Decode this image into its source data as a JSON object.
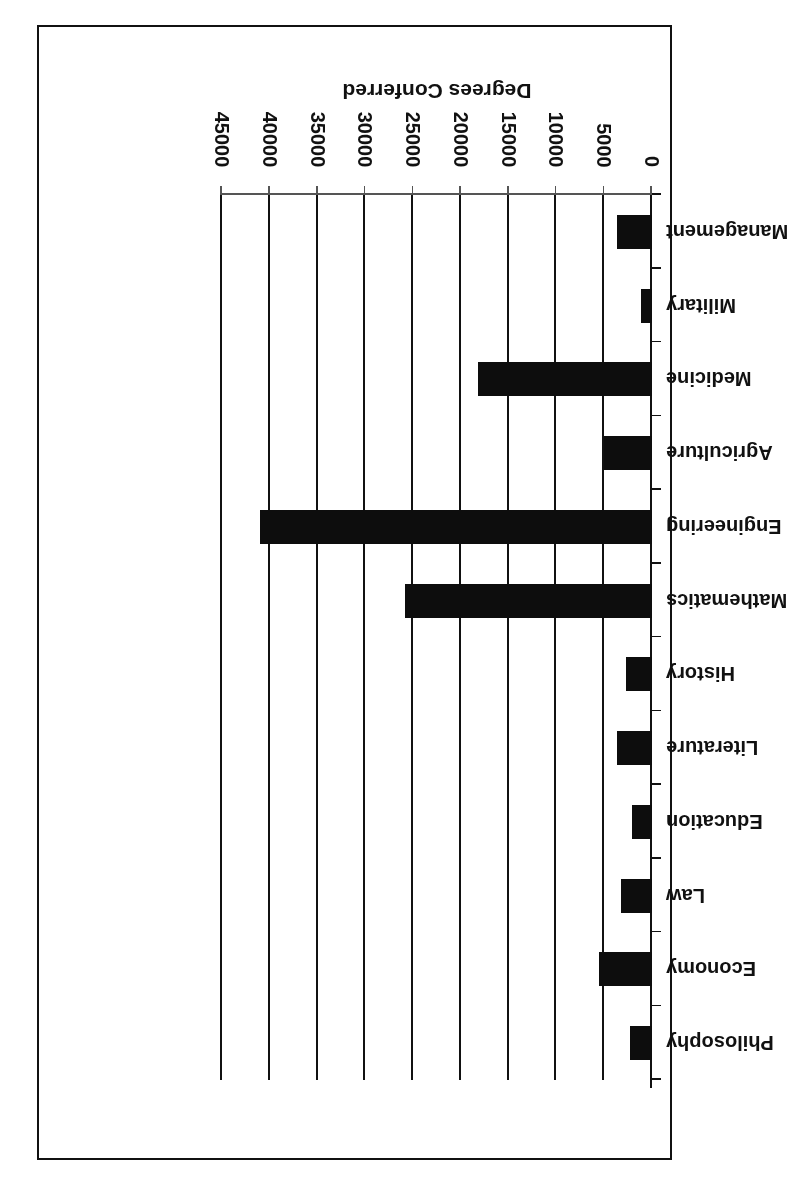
{
  "figure": {
    "axis_title": "Degrees Conferred",
    "orientation_note": "rotated-180",
    "bar_color": "#0d0d0d",
    "axis_color": "#111111"
  },
  "chart_data": {
    "type": "bar",
    "title": "",
    "xlabel": "Degrees Conferred",
    "ylabel": "",
    "orientation": "horizontal",
    "grid": true,
    "legend": false,
    "xlim": [
      0,
      45000
    ],
    "ticks": [
      0,
      5000,
      10000,
      15000,
      20000,
      25000,
      30000,
      35000,
      40000,
      45000
    ],
    "tick_labels": [
      "0",
      "5000",
      "10000",
      "15000",
      "20000",
      "25000",
      "30000",
      "35000",
      "40000",
      "45000"
    ],
    "categories": [
      "Philosophy",
      "Economy",
      "Law",
      "Education",
      "Literature",
      "History",
      "Mathematics",
      "Engineering",
      "Agriculture",
      "Medicine",
      "Military",
      "Management"
    ],
    "values": [
      2300,
      5500,
      3200,
      2100,
      3700,
      2700,
      25800,
      41000,
      5000,
      18200,
      1100,
      3700
    ]
  }
}
